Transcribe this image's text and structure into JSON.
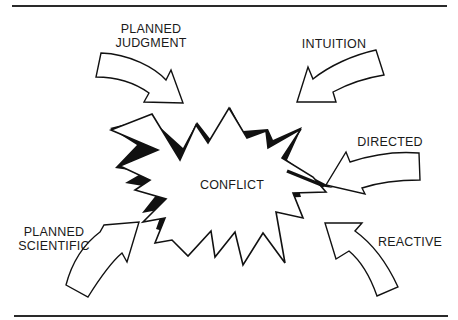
{
  "diagram": {
    "center": {
      "label": "CONFLICT"
    },
    "inputs": [
      {
        "id": "planned-judgment",
        "line1": "PLANNED",
        "line2": "JUDGMENT"
      },
      {
        "id": "intuition",
        "line1": "INTUITION"
      },
      {
        "id": "directed",
        "line1": "DIRECTED"
      },
      {
        "id": "planned-scientific",
        "line1": "PLANNED",
        "line2": "SCIENTIFIC"
      },
      {
        "id": "reactive",
        "line1": "REACTIVE"
      }
    ],
    "colors": {
      "ink": "#1a1a1a",
      "background": "#ffffff"
    }
  }
}
